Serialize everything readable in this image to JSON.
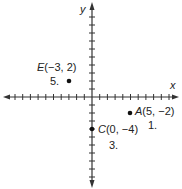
{
  "diagram": {
    "type": "coordinate-plane",
    "axes": {
      "x_label": "x",
      "y_label": "y",
      "origin_px": [
        92,
        97
      ],
      "unit_px_x": 7.7,
      "unit_px_y": 8,
      "x_range": [
        -11,
        11
      ],
      "y_range": [
        -11,
        11
      ],
      "color": "#333333"
    },
    "points": [
      {
        "name": "A",
        "coords": "(5, −2)",
        "x": 5,
        "y": -2,
        "number": "1."
      },
      {
        "name": "C",
        "coords": "(0, −4)",
        "x": 0,
        "y": -4,
        "number": "3."
      },
      {
        "name": "E",
        "coords": "(−3, 2)",
        "x": -3,
        "y": 2,
        "number": "5."
      }
    ]
  }
}
